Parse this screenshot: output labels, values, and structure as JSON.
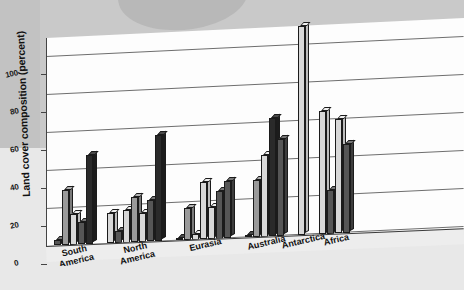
{
  "figure": {
    "kind": "3d-bar-chart-scan",
    "background_color": "#c9c9c9",
    "paper_color": "#e8e8e8",
    "plot_area_color": "#fdfdfd",
    "gridline_color": "#6e6e6e",
    "axis_color": "#333333"
  },
  "chart_data": {
    "type": "bar",
    "title": "",
    "xlabel": "",
    "ylabel": "Land cover composition (percent)",
    "ylim": [
      0,
      110
    ],
    "yticks": [
      0,
      20,
      40,
      60,
      80,
      100
    ],
    "ytick_labels": [
      "0",
      "20",
      "40",
      "60",
      "80",
      "100"
    ],
    "grid": true,
    "grid_axis": "y",
    "legend": "none",
    "projection": "3d-perspective",
    "categories": [
      "South America",
      "North America",
      "Eurasia",
      "Australia",
      "Antarctica",
      "Africa"
    ],
    "category_labels": [
      "South\nAmerica",
      "North\nAmerica",
      "Eurasia",
      "Australia",
      "Antarctica",
      "Africa"
    ],
    "groups": [
      {
        "name": "South America",
        "label": "South\nAmerica",
        "values": [
          3,
          29,
          16,
          12,
          47
        ],
        "shades": [
          "dark",
          "mid",
          "light",
          "dark",
          "darkest"
        ]
      },
      {
        "name": "North America",
        "label": "North\nAmerica",
        "values": [
          16,
          6,
          17,
          24,
          15,
          22,
          56
        ],
        "shades": [
          "light",
          "dark",
          "light",
          "mid",
          "light",
          "dark",
          "darkest"
        ]
      },
      {
        "name": "Eurasia",
        "label": "Eurasia",
        "values": [
          1,
          17,
          3,
          30,
          17,
          25,
          30
        ],
        "shades": [
          "darkest",
          "mid",
          "light",
          "light",
          "light",
          "dark",
          "dark"
        ]
      },
      {
        "name": "Australia",
        "label": "Australia",
        "values": [
          1,
          30,
          43,
          62,
          51
        ],
        "shades": [
          "darkest",
          "mid",
          "light",
          "darkest",
          "dark"
        ]
      },
      {
        "name": "Antarctica",
        "label": "Antarctica",
        "values": [
          110
        ],
        "shades": [
          "light"
        ]
      },
      {
        "name": "Africa",
        "label": "Africa",
        "values": [
          65,
          23,
          60,
          47
        ],
        "shades": [
          "light",
          "dark",
          "light",
          "dark"
        ]
      }
    ]
  }
}
